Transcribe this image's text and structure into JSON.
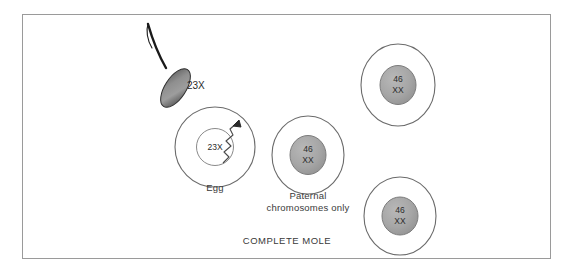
{
  "figure": {
    "caption": "COMPLETE MOLE",
    "border_color": "#9a9a9a",
    "background": "#ffffff"
  },
  "sperm": {
    "label": "23X",
    "head_color_dark": "#3d3d3d",
    "head_color_light": "#b9b9b9",
    "tail_color": "#1a1a1a"
  },
  "extrusion_arrow": {
    "name": "maternal-nucleus-extrusion-arrow",
    "color": "#4a4a4a"
  },
  "cells": [
    {
      "id": "egg",
      "label": "Egg",
      "nucleus_line1": "23X",
      "nucleus_line2": "",
      "nucleus_fill": "#ffffff",
      "membrane_color": "#6b6b6b"
    },
    {
      "id": "paternal",
      "label_line1": "Paternal",
      "label_line2": "chromosomes only",
      "nucleus_line1": "46",
      "nucleus_line2": "XX",
      "nucleus_fill": "#a8a8a8",
      "membrane_color": "#6b6b6b"
    },
    {
      "id": "daughter-upper",
      "label_line1": "",
      "label_line2": "",
      "nucleus_line1": "46",
      "nucleus_line2": "XX",
      "nucleus_fill": "#a8a8a8",
      "membrane_color": "#6b6b6b"
    },
    {
      "id": "daughter-lower",
      "label_line1": "",
      "label_line2": "",
      "nucleus_line1": "46",
      "nucleus_line2": "XX",
      "nucleus_fill": "#a8a8a8",
      "membrane_color": "#6b6b6b"
    }
  ]
}
